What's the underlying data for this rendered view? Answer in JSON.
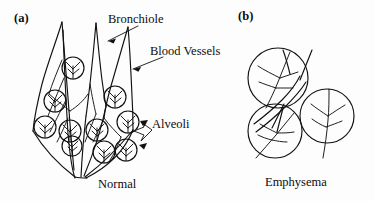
{
  "figure": {
    "background_color": "#fdfdfd",
    "ink_color": "#111111"
  },
  "panels": [
    {
      "letter": "(a)",
      "caption": "Normal",
      "callouts": [
        {
          "text": "Bronchiole",
          "arrows": 1
        },
        {
          "text": "Blood Vessels",
          "arrows": 1
        },
        {
          "text": "Alveoli",
          "arrows": 2
        }
      ],
      "alveoli_count": 10
    },
    {
      "letter": "(b)",
      "caption": "Emphysema",
      "callouts": [],
      "alveoli_count": 3
    }
  ],
  "labels": {
    "panel_a_letter": "(a)",
    "panel_b_letter": "(b)",
    "bronchiole": "Bronchiole",
    "blood_vessels": "Blood Vessels",
    "alveoli": "Alveoli",
    "caption_normal": "Normal",
    "caption_emphysema": "Emphysema"
  }
}
